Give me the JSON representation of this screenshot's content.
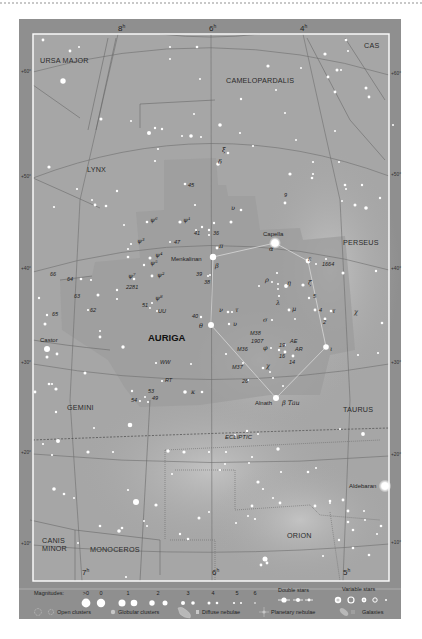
{
  "chart": {
    "title": "Auriga",
    "constellations": [
      {
        "name": "URSA MAJOR",
        "x": 40,
        "y": 63
      },
      {
        "name": "CAS",
        "x": 364,
        "y": 48
      },
      {
        "name": "CAMELOPARDALIS",
        "x": 226,
        "y": 83
      },
      {
        "name": "LYNX",
        "x": 87,
        "y": 172
      },
      {
        "name": "PERSEUS",
        "x": 343,
        "y": 245
      },
      {
        "name": "GEMINI",
        "x": 67,
        "y": 410
      },
      {
        "name": "TAURUS",
        "x": 343,
        "y": 412
      },
      {
        "name": "ORION",
        "x": 287,
        "y": 538
      },
      {
        "name": "MONOCEROS",
        "x": 90,
        "y": 552
      },
      {
        "name": "CANIS",
        "x": 42,
        "y": 543
      },
      {
        "name": "MINOR",
        "x": 42,
        "y": 551
      }
    ],
    "main_constellation": {
      "name": "AURIGA",
      "x": 148,
      "y": 341
    },
    "ra_labels": [
      {
        "text": "8",
        "sup": "h",
        "x": 118,
        "y": 31
      },
      {
        "text": "6",
        "sup": "h",
        "x": 209,
        "y": 31
      },
      {
        "text": "4",
        "sup": "h",
        "x": 300,
        "y": 31
      },
      {
        "text": "7",
        "sup": "h",
        "x": 82,
        "y": 575
      },
      {
        "text": "6",
        "sup": "h",
        "x": 212,
        "y": 575
      },
      {
        "text": "5",
        "sup": "h",
        "x": 343,
        "y": 575
      }
    ],
    "dec_labels_left": [
      {
        "text": "+60°",
        "y": 73
      },
      {
        "text": "+50°",
        "y": 178
      },
      {
        "text": "+40°",
        "y": 270
      },
      {
        "text": "+30°",
        "y": 364
      },
      {
        "text": "+20°",
        "y": 454
      },
      {
        "text": "+10°",
        "y": 545
      }
    ],
    "dec_labels_right": [
      {
        "text": "+60°",
        "y": 75
      },
      {
        "text": "+50°",
        "y": 176
      },
      {
        "text": "+40°",
        "y": 270
      },
      {
        "text": "+30°",
        "y": 364
      },
      {
        "text": "+20°",
        "y": 456
      },
      {
        "text": "+10°",
        "y": 544
      }
    ],
    "ecliptic_label": "ECLIPTIC",
    "named_stars": [
      {
        "name": "Capella",
        "greek": "α",
        "x": 275,
        "y": 243
      },
      {
        "name": "Menkalinan",
        "greek": "β",
        "x": 213,
        "y": 257
      },
      {
        "name": "Castor",
        "x": 47,
        "y": 349
      },
      {
        "name": "Alnath",
        "greek": "β Tau",
        "x": 276,
        "y": 398
      },
      {
        "name": "Aldebaran",
        "x": 385,
        "y": 486
      }
    ],
    "star_labels": [
      {
        "t": "ξ",
        "x": 222,
        "y": 152,
        "k": "greek"
      },
      {
        "t": "δ",
        "x": 218,
        "y": 164,
        "k": "greek"
      },
      {
        "t": "45",
        "x": 188,
        "y": 187,
        "k": "num"
      },
      {
        "t": "9",
        "x": 284,
        "y": 197,
        "k": "num"
      },
      {
        "t": "υ",
        "x": 231,
        "y": 210,
        "k": "greek"
      },
      {
        "t": "ψ⁶",
        "x": 150,
        "y": 222,
        "k": "greek"
      },
      {
        "t": "ψ¹",
        "x": 183,
        "y": 222,
        "k": "greek"
      },
      {
        "t": "41",
        "x": 194,
        "y": 235,
        "k": "num"
      },
      {
        "t": "36",
        "x": 213,
        "y": 235,
        "k": "num"
      },
      {
        "t": "ψ³",
        "x": 137,
        "y": 243,
        "k": "greek"
      },
      {
        "t": "47",
        "x": 174,
        "y": 244,
        "k": "num"
      },
      {
        "t": "π",
        "x": 219,
        "y": 248,
        "k": "greek"
      },
      {
        "t": "ψ⁴",
        "x": 155,
        "y": 257,
        "k": "greek"
      },
      {
        "t": "ψ⁵",
        "x": 150,
        "y": 265,
        "k": "greek"
      },
      {
        "t": "ε",
        "x": 308,
        "y": 261,
        "k": "greek"
      },
      {
        "t": "1664",
        "x": 322,
        "y": 266,
        "k": "num"
      },
      {
        "t": "66",
        "x": 50,
        "y": 276,
        "k": "num"
      },
      {
        "t": "64",
        "x": 67,
        "y": 281,
        "k": "num"
      },
      {
        "t": "ψ⁷",
        "x": 128,
        "y": 278,
        "k": "greek"
      },
      {
        "t": "ψ²",
        "x": 157,
        "y": 277,
        "k": "greek"
      },
      {
        "t": "39",
        "x": 196,
        "y": 276,
        "k": "num"
      },
      {
        "t": "38",
        "x": 204,
        "y": 284,
        "k": "num"
      },
      {
        "t": "ρ",
        "x": 265,
        "y": 282,
        "k": "greek"
      },
      {
        "t": "η",
        "x": 287,
        "y": 285,
        "k": "greek"
      },
      {
        "t": "ζ",
        "x": 308,
        "y": 285,
        "k": "greek"
      },
      {
        "t": "2281",
        "x": 126,
        "y": 289,
        "k": "num"
      },
      {
        "t": "63",
        "x": 74,
        "y": 298,
        "k": "num"
      },
      {
        "t": "5",
        "x": 313,
        "y": 298,
        "k": "num"
      },
      {
        "t": "λ",
        "x": 276,
        "y": 305,
        "k": "greek"
      },
      {
        "t": "ψ⁸",
        "x": 155,
        "y": 300,
        "k": "greek"
      },
      {
        "t": "51",
        "x": 142,
        "y": 307,
        "k": "num"
      },
      {
        "t": "UU",
        "x": 158,
        "y": 313,
        "k": "num"
      },
      {
        "t": "62",
        "x": 90,
        "y": 312,
        "k": "num"
      },
      {
        "t": "65",
        "x": 52,
        "y": 316,
        "k": "num"
      },
      {
        "t": "μ",
        "x": 292,
        "y": 311,
        "k": "greek"
      },
      {
        "t": "4",
        "x": 319,
        "y": 312,
        "k": "num"
      },
      {
        "t": "τ",
        "x": 332,
        "y": 313,
        "k": "greek"
      },
      {
        "t": "χ",
        "x": 354,
        "y": 314,
        "k": "greek"
      },
      {
        "t": "2",
        "x": 323,
        "y": 324,
        "k": "num"
      },
      {
        "t": "40",
        "x": 192,
        "y": 318,
        "k": "num"
      },
      {
        "t": "ν",
        "x": 219,
        "y": 312,
        "k": "greek"
      },
      {
        "t": "τ",
        "x": 235,
        "y": 312,
        "k": "greek"
      },
      {
        "t": "σ",
        "x": 263,
        "y": 322,
        "k": "greek"
      },
      {
        "t": "θ",
        "x": 199,
        "y": 328,
        "k": "greek"
      },
      {
        "t": "υ",
        "x": 233,
        "y": 326,
        "k": "greek"
      },
      {
        "t": "M38",
        "x": 250,
        "y": 335,
        "k": "num"
      },
      {
        "t": "1907",
        "x": 251,
        "y": 343,
        "k": "num"
      },
      {
        "t": "M36",
        "x": 237,
        "y": 351,
        "k": "num"
      },
      {
        "t": "φ",
        "x": 263,
        "y": 350,
        "k": "greek"
      },
      {
        "t": "19",
        "x": 279,
        "y": 347,
        "k": "num"
      },
      {
        "t": "AE",
        "x": 290,
        "y": 343,
        "k": "num"
      },
      {
        "t": "AR",
        "x": 295,
        "y": 351,
        "k": "num"
      },
      {
        "t": "16",
        "x": 279,
        "y": 358,
        "k": "num"
      },
      {
        "t": "14",
        "x": 289,
        "y": 364,
        "k": "num"
      },
      {
        "t": "ι",
        "x": 330,
        "y": 351,
        "k": "greek"
      },
      {
        "t": "M37",
        "x": 232,
        "y": 369,
        "k": "num"
      },
      {
        "t": "χ",
        "x": 266,
        "y": 368,
        "k": "greek"
      },
      {
        "t": "26",
        "x": 242,
        "y": 383,
        "k": "num"
      },
      {
        "t": "WW",
        "x": 160,
        "y": 364,
        "k": "num"
      },
      {
        "t": "RT",
        "x": 165,
        "y": 382,
        "k": "num"
      },
      {
        "t": "53",
        "x": 148,
        "y": 393,
        "k": "num"
      },
      {
        "t": "κ",
        "x": 191,
        "y": 394,
        "k": "greek"
      },
      {
        "t": "54",
        "x": 131,
        "y": 402,
        "k": "num"
      },
      {
        "t": "49",
        "x": 152,
        "y": 400,
        "k": "num"
      }
    ]
  },
  "legend": {
    "magnitudes_label": "Magnitudes:",
    "magnitudes": [
      ">0",
      "0",
      "1",
      "2",
      "3",
      "4",
      "5",
      "6"
    ],
    "double_stars_label": "Double stars",
    "variable_stars_label": "Variable stars",
    "open_clusters_label": "Open clusters",
    "globular_clusters_label": "Globular clusters",
    "diffuse_nebulae_label": "Diffuse nebulae",
    "planetary_nebulae_label": "Planetary nebulae",
    "galaxies_label": "Galaxies"
  },
  "colors": {
    "frame": "#8f8f8f",
    "sky": "#a8a8a8",
    "auriga_region": "#9a9a9a",
    "milky_way": "#bdbdbd",
    "star": "#ffffff",
    "grid_line": "#7a7a7a",
    "border_inner": "#ffffff"
  }
}
